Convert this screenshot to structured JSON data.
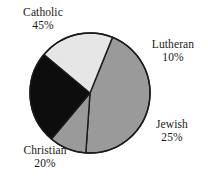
{
  "chart_data": {
    "type": "pie",
    "title": "",
    "subtitle": "",
    "xlabel": "",
    "ylabel": "",
    "grid": false,
    "legend_position": "outside-labels",
    "start_angle_deg": -68,
    "direction": "clockwise",
    "center": {
      "x": 90,
      "y": 93
    },
    "radius": 60,
    "categories": [
      "Catholic",
      "Lutheran",
      "Jewish",
      "Christian"
    ],
    "values": [
      45,
      10,
      25,
      20
    ],
    "value_unit": "%",
    "slices": [
      {
        "label": "Catholic",
        "value": 45,
        "value_text": "45%",
        "color": "#9a9a9a",
        "stroke": "#1a1a1a"
      },
      {
        "label": "Lutheran",
        "value": 10,
        "value_text": "10%",
        "color": "#9a9a9a",
        "stroke": "#1a1a1a"
      },
      {
        "label": "Jewish",
        "value": 25,
        "value_text": "25%",
        "color": "#0d0d0d",
        "stroke": "#1a1a1a"
      },
      {
        "label": "Christian",
        "value": 20,
        "value_text": "20%",
        "color": "#e6e6e6",
        "stroke": "#1a1a1a"
      }
    ]
  },
  "labels": {
    "catholic": {
      "name": "Catholic",
      "value": "45%"
    },
    "lutheran": {
      "name": "Lutheran",
      "value": "10%"
    },
    "jewish": {
      "name": "Jewish",
      "value": "25%"
    },
    "christian": {
      "name": "Christian",
      "value": "20%"
    }
  },
  "colors": {
    "background": "#ffffff",
    "outline": "#1a1a1a",
    "text": "#1a1a1a",
    "slice_gray": "#9a9a9a",
    "slice_black": "#0d0d0d",
    "slice_light": "#e6e6e6"
  }
}
